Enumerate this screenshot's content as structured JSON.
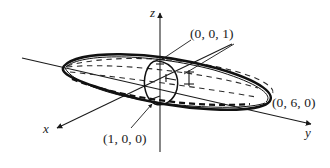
{
  "figure": {
    "kind": "3d-ellipsoid-diagram",
    "background_color": "#ffffff",
    "ink_color": "#1a1a1a",
    "axes": [
      {
        "id": "x",
        "label": "x",
        "direction": "down-left",
        "arrow": true
      },
      {
        "id": "y",
        "label": "y",
        "direction": "right",
        "arrow": true
      },
      {
        "id": "z",
        "label": "z",
        "direction": "up",
        "arrow": true
      }
    ],
    "point_labels": [
      {
        "id": "top-vertex",
        "text": "(0, 0, 1)",
        "leader_lines": 2
      },
      {
        "id": "y-vertex",
        "text": "(0, 6, 0)",
        "leader_lines": 0
      },
      {
        "id": "x-vertex",
        "text": "(1, 0, 0)",
        "leader_lines": 1
      }
    ],
    "surface": {
      "name": "ellipsoid",
      "silhouette": "tilted-ellipse",
      "hidden_lines": "dashed",
      "cross_section": "vertical-circle-at-origin"
    }
  }
}
